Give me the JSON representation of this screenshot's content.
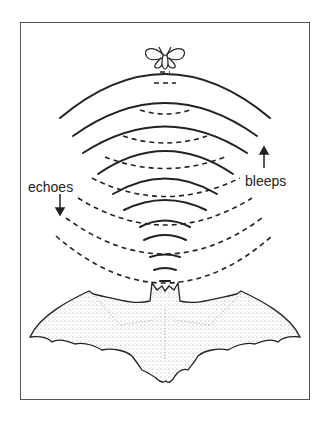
{
  "figure": {
    "labels": {
      "echoes": "echoes",
      "bleeps": "bleeps"
    },
    "elements": {
      "top_subject": "moth",
      "bottom_subject": "bat",
      "emitted_waves": "solid arcs (bleeps) traveling upward",
      "reflected_waves": "dashed arcs (echoes) traveling downward"
    },
    "arrows": {
      "echoes": "down",
      "bleeps": "up"
    },
    "colors": {
      "ink": "#222222",
      "frame": "#555555",
      "background": "#ffffff"
    }
  }
}
